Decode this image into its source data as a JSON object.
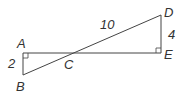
{
  "diagram": {
    "type": "geometry",
    "points": {
      "A": {
        "label": "A"
      },
      "B": {
        "label": "B"
      },
      "C": {
        "label": "C"
      },
      "D": {
        "label": "D"
      },
      "E": {
        "label": "E"
      }
    },
    "measures": {
      "AB": "2",
      "CD": "10",
      "DE": "4"
    },
    "right_angles": [
      "A",
      "E"
    ],
    "colors": {
      "stroke": "#444444",
      "text": "#333333"
    }
  }
}
